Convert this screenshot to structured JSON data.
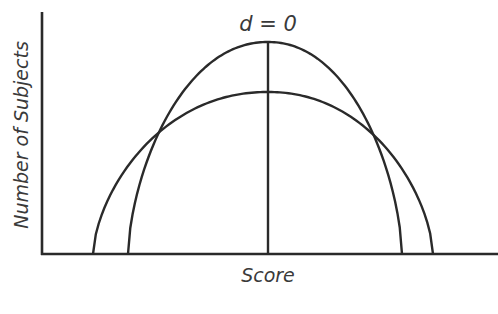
{
  "chart_data": {
    "type": "line",
    "title": "d = 0",
    "xlabel": "Score",
    "ylabel": "Number of Subjects",
    "grid": false,
    "legend": null,
    "annotation": "vertical line at shared mean (d = 0)",
    "series": [
      {
        "name": "narrow-distribution",
        "description": "taller, narrower curve",
        "x_start": 128,
        "x_end": 402,
        "x_peak": 268,
        "peak_y": 42
      },
      {
        "name": "wide-distribution",
        "description": "shorter, wider curve",
        "x_start": 93,
        "x_end": 433,
        "x_peak": 268,
        "peak_y": 92
      }
    ],
    "mean_line": {
      "x": 268,
      "y_top": 42,
      "y_bottom": 254
    },
    "axes": {
      "origin_x": 42,
      "baseline_y": 254,
      "y_top": 12,
      "x_right": 498
    }
  },
  "labels": {
    "title": "d = 0",
    "x_axis": "Score",
    "y_axis": "Number of Subjects"
  },
  "colors": {
    "ink": "#2a2a2a",
    "text": "#3a3a3a",
    "background": "#ffffff"
  }
}
